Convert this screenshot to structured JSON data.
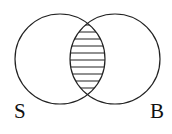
{
  "diagram": {
    "type": "venn",
    "sets": [
      {
        "name": "S",
        "label": "S"
      },
      {
        "name": "B",
        "label": "B"
      }
    ],
    "shaded_region": "S ∩ B",
    "shading_style": "horizontal-lines",
    "colors": {
      "stroke": "#222222",
      "background": "#ffffff"
    }
  }
}
